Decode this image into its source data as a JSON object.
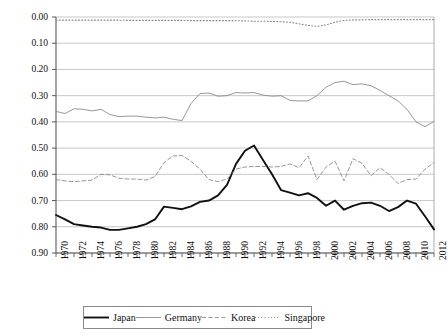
{
  "chart_data": {
    "type": "line",
    "title": "",
    "xlabel": "",
    "ylabel": "",
    "xlim": [
      1970,
      2012
    ],
    "ylim": [
      0.0,
      0.9
    ],
    "y_inverted": true,
    "grid": true,
    "legend_position": "bottom",
    "ytick_labels": [
      "0.00",
      "0.10",
      "0.20",
      "0.30",
      "0.40",
      "0.50",
      "0.60",
      "0.70",
      "0.80",
      "0.90"
    ],
    "ytick_values": [
      0.0,
      0.1,
      0.2,
      0.3,
      0.4,
      0.5,
      0.6,
      0.7,
      0.8,
      0.9
    ],
    "xtick_labels": [
      "1970",
      "1972",
      "1974",
      "1976",
      "1978",
      "1980",
      "1982",
      "1984",
      "1986",
      "1988",
      "1990",
      "1992",
      "1994",
      "1996",
      "1998",
      "2000",
      "2002",
      "2004",
      "2006",
      "2008",
      "2010",
      "2012"
    ],
    "xtick_values": [
      1970,
      1972,
      1974,
      1976,
      1978,
      1980,
      1982,
      1984,
      1986,
      1988,
      1990,
      1992,
      1994,
      1996,
      1998,
      2000,
      2002,
      2004,
      2006,
      2008,
      2010,
      2012
    ],
    "x": [
      1970,
      1971,
      1972,
      1973,
      1974,
      1975,
      1976,
      1977,
      1978,
      1979,
      1980,
      1981,
      1982,
      1983,
      1984,
      1985,
      1986,
      1987,
      1988,
      1989,
      1990,
      1991,
      1992,
      1993,
      1994,
      1995,
      1996,
      1997,
      1998,
      1999,
      2000,
      2001,
      2002,
      2003,
      2004,
      2005,
      2006,
      2007,
      2008,
      2009,
      2010,
      2011,
      2012
    ],
    "series": [
      {
        "name": "Japan",
        "style": "solid-thick",
        "color": "#111111",
        "values": [
          0.755,
          0.772,
          0.79,
          0.795,
          0.8,
          0.803,
          0.812,
          0.812,
          0.806,
          0.8,
          0.79,
          0.772,
          0.723,
          0.728,
          0.733,
          0.722,
          0.705,
          0.7,
          0.68,
          0.64,
          0.56,
          0.51,
          0.49,
          0.545,
          0.6,
          0.66,
          0.67,
          0.68,
          0.672,
          0.69,
          0.72,
          0.7,
          0.735,
          0.72,
          0.71,
          0.708,
          0.72,
          0.74,
          0.725,
          0.7,
          0.712,
          0.76,
          0.81
        ]
      },
      {
        "name": "Germany",
        "style": "solid-thin",
        "color": "#8c8c8c",
        "values": [
          0.36,
          0.368,
          0.35,
          0.352,
          0.358,
          0.352,
          0.372,
          0.38,
          0.378,
          0.378,
          0.382,
          0.385,
          0.382,
          0.39,
          0.395,
          0.33,
          0.292,
          0.29,
          0.302,
          0.3,
          0.288,
          0.29,
          0.288,
          0.298,
          0.302,
          0.3,
          0.318,
          0.32,
          0.32,
          0.3,
          0.268,
          0.25,
          0.245,
          0.258,
          0.255,
          0.262,
          0.28,
          0.3,
          0.32,
          0.352,
          0.4,
          0.418,
          0.398
        ]
      },
      {
        "name": "Korea",
        "style": "dashed",
        "color": "#8c8c8c",
        "values": [
          0.62,
          0.625,
          0.628,
          0.625,
          0.622,
          0.6,
          0.602,
          0.615,
          0.618,
          0.618,
          0.622,
          0.608,
          0.555,
          0.53,
          0.528,
          0.55,
          0.58,
          0.62,
          0.628,
          0.618,
          0.58,
          0.572,
          0.57,
          0.57,
          0.572,
          0.57,
          0.56,
          0.575,
          0.53,
          0.62,
          0.572,
          0.55,
          0.625,
          0.54,
          0.558,
          0.605,
          0.575,
          0.6,
          0.635,
          0.62,
          0.618,
          0.58,
          0.555
        ]
      },
      {
        "name": "Singapore",
        "style": "dotted",
        "color": "#8c8c8c",
        "values": [
          0.012,
          0.012,
          0.012,
          0.012,
          0.012,
          0.012,
          0.012,
          0.012,
          0.013,
          0.013,
          0.013,
          0.013,
          0.013,
          0.013,
          0.013,
          0.014,
          0.014,
          0.014,
          0.014,
          0.014,
          0.014,
          0.015,
          0.016,
          0.016,
          0.017,
          0.018,
          0.02,
          0.026,
          0.032,
          0.036,
          0.03,
          0.02,
          0.013,
          0.011,
          0.011,
          0.01,
          0.01,
          0.01,
          0.01,
          0.01,
          0.01,
          0.01,
          0.01
        ]
      }
    ]
  },
  "legend": {
    "entries": [
      {
        "label": "Japan"
      },
      {
        "label": "Germany"
      },
      {
        "label": "Korea"
      },
      {
        "label": "Singapore"
      }
    ]
  }
}
